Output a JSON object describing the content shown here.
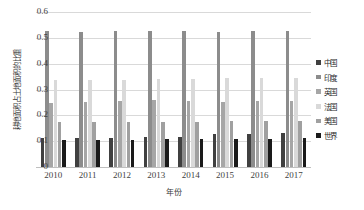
{
  "chart_data": {
    "type": "bar",
    "title": "",
    "xlabel": "年份",
    "ylabel": "耕地面积占土地面积的比重",
    "categories": [
      "2010",
      "2011",
      "2012",
      "2013",
      "2014",
      "2015",
      "2016",
      "2017"
    ],
    "ylim": [
      0,
      0.6
    ],
    "yticks": [
      "0",
      "0.1",
      "0.2",
      "0.3",
      "0.4",
      "0.5",
      "0.6"
    ],
    "ytick_values": [
      0,
      0.1,
      0.2,
      0.3,
      0.4,
      0.5,
      0.6
    ],
    "grid": true,
    "legend_position": "right",
    "series": [
      {
        "name": "中国",
        "color": "#404040",
        "values": [
          0.112,
          0.113,
          0.114,
          0.115,
          0.117,
          0.128,
          0.129,
          0.13
        ]
      },
      {
        "name": "印度",
        "color": "#8c8c8c",
        "values": [
          0.525,
          0.524,
          0.525,
          0.525,
          0.526,
          0.524,
          0.526,
          0.528
        ]
      },
      {
        "name": "英国",
        "color": "#a6a6a6",
        "values": [
          0.249,
          0.251,
          0.256,
          0.261,
          0.257,
          0.252,
          0.255,
          0.257
        ]
      },
      {
        "name": "法国",
        "color": "#d9d9d9",
        "values": [
          0.336,
          0.336,
          0.337,
          0.34,
          0.341,
          0.343,
          0.344,
          0.345
        ]
      },
      {
        "name": "美国",
        "color": "#a0a0a0",
        "values": [
          0.175,
          0.174,
          0.174,
          0.175,
          0.176,
          0.177,
          0.178,
          0.18
        ]
      },
      {
        "name": "世界",
        "color": "#1a1a1a",
        "values": [
          0.105,
          0.106,
          0.106,
          0.108,
          0.108,
          0.109,
          0.11,
          0.111
        ]
      }
    ]
  }
}
